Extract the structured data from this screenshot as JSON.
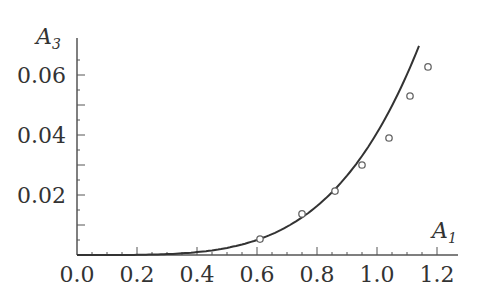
{
  "chart_data": {
    "type": "scatter",
    "title": "",
    "xlabel": "A1",
    "ylabel": "A3",
    "xlim": [
      0.0,
      1.25
    ],
    "ylim": [
      0.0,
      0.07
    ],
    "grid": false,
    "x_ticks": [
      "0.0",
      "0.2",
      "0.4",
      "0.6",
      "0.8",
      "1.0",
      "1.2"
    ],
    "y_ticks": [
      "0.02",
      "0.04",
      "0.06"
    ],
    "series": [
      {
        "name": "theory",
        "kind": "line",
        "x": [
          0.0,
          0.1,
          0.2,
          0.3,
          0.4,
          0.5,
          0.6,
          0.7,
          0.8,
          0.9,
          1.0,
          1.05,
          1.1,
          1.14
        ],
        "values": [
          0.0,
          4e-05,
          0.0005,
          0.0013,
          0.0026,
          0.0043,
          0.0058,
          0.0095,
          0.0164,
          0.0262,
          0.0398,
          0.0483,
          0.0581,
          0.0697
        ]
      },
      {
        "name": "experiment",
        "kind": "scatter",
        "marker": "open-circle",
        "x": [
          0.61,
          0.75,
          0.86,
          0.95,
          1.04,
          1.11,
          1.17
        ],
        "values": [
          0.0053,
          0.0137,
          0.0213,
          0.03,
          0.039,
          0.053,
          0.0627
        ]
      }
    ]
  },
  "labels": {
    "x_axis_main": "A",
    "x_axis_sub": "1",
    "y_axis_main": "A",
    "y_axis_sub": "3"
  },
  "colors": {
    "axis": "#555555",
    "line": "#333333",
    "marker": "#666666"
  }
}
